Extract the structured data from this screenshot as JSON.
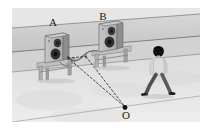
{
  "figure": {
    "kind": "physics-diagram",
    "labels": [
      {
        "id": "speaker-a",
        "text": "A",
        "x": 53,
        "y": 26,
        "font_size": 11
      },
      {
        "id": "speaker-b",
        "text": "B",
        "x": 103,
        "y": 20,
        "font_size": 11
      },
      {
        "id": "point-o",
        "text": "O",
        "x": 126,
        "y": 118,
        "font_size": 11
      }
    ],
    "colors": {
      "page_background": "#ffffff",
      "ground_upper": "#e2e2e2",
      "ground_lower": "#d8d8d8",
      "road_band": "#cfcfcf",
      "road_band_edge": "#9a9a9a",
      "speaker_body": "#b8b8b8",
      "speaker_body_side": "#8f8f8f",
      "speaker_face": "#c9c9c9",
      "cone_dark": "#3a3a3a",
      "stand": "#b2b2b2",
      "stand_dark": "#8a8a8a",
      "person_shirt": "#d9d9d9",
      "person_trousers": "#5a5a5a",
      "person_hair": "#141414",
      "dash_line": "#2b2b2b",
      "cable": "#6f6f6f",
      "dot": "#0d0d0d",
      "label_text": "#1a1a1a"
    },
    "objects": {
      "speaker_a": {
        "name": "loudspeaker-a",
        "cx": 57,
        "cy": 48
      },
      "speaker_b": {
        "name": "loudspeaker-b",
        "cx": 110,
        "cy": 38
      },
      "person": {
        "name": "walking-person",
        "cx": 160,
        "cy": 70
      },
      "origin_dot": {
        "name": "point-o-dot",
        "cx": 125,
        "cy": 108,
        "r": 2.4
      },
      "cable": {
        "name": "speaker-connecting-cable"
      }
    },
    "dashed_paths": [
      {
        "name": "dashed-line-a-to-o",
        "from": [
          68,
          58
        ],
        "to": [
          125,
          108
        ]
      },
      {
        "name": "dashed-line-b-to-o",
        "from": [
          86,
          57
        ],
        "to": [
          125,
          108
        ]
      },
      {
        "name": "dashed-bracket-top",
        "from": [
          68,
          58
        ],
        "to": [
          86,
          57
        ]
      }
    ],
    "ground_lines": [
      {
        "name": "embankment-top-edge",
        "from": [
          12,
          28
        ],
        "to": [
          200,
          14
        ]
      },
      {
        "name": "embankment-bottom-edge",
        "from": [
          12,
          52
        ],
        "to": [
          200,
          36
        ]
      },
      {
        "name": "road-far-edge",
        "from": [
          12,
          72
        ],
        "to": [
          200,
          54
        ]
      },
      {
        "name": "road-near-edge",
        "from": [
          12,
          122
        ],
        "to": [
          200,
          96
        ]
      }
    ],
    "frame": {
      "left": 12,
      "top": 8,
      "right": 200,
      "bottom": 122
    }
  }
}
